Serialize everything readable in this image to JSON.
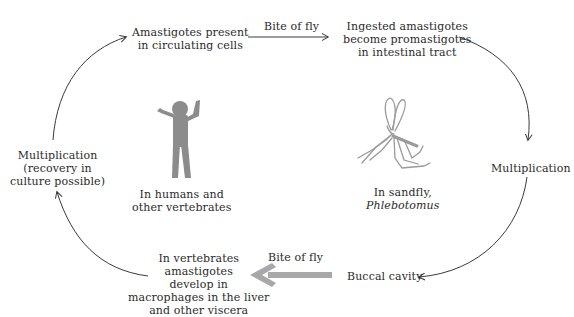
{
  "diagram": {
    "type": "life-cycle",
    "nodes": {
      "amastigotes_circulating": [
        "Amastigotes present",
        "in circulating cells"
      ],
      "ingested": [
        "Ingested amastigotes",
        "become promastigotes",
        "in intestinal tract"
      ],
      "multiplication_fly": [
        "Multiplication"
      ],
      "buccal": [
        "Buccal cavity"
      ],
      "vertebrate_develop": [
        "In vertebrates",
        "amastigotes",
        "develop in",
        "macrophages in the liver",
        "and other viscera"
      ],
      "multiplication_host": [
        "Multiplication",
        "(recovery in",
        "culture possible)"
      ]
    },
    "edges": {
      "bite_top": "Bite of fly",
      "bite_bottom": "Bite of fly"
    },
    "hosts": {
      "human": [
        "In humans and",
        "other vertebrates"
      ],
      "sandfly_line1": "In sandfly,",
      "sandfly_line2": "Phlebotomus"
    },
    "colors": {
      "text": "#2a2a2a",
      "line": "#3a3a3a",
      "figure": "#8c8c8c",
      "big_arrow": "#a8a8a8"
    }
  }
}
